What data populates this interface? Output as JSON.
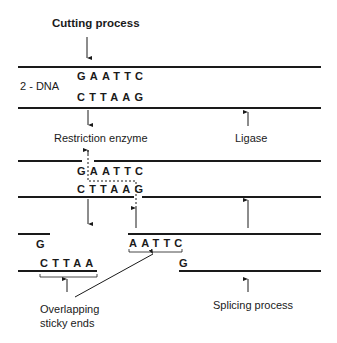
{
  "title": "Cutting process",
  "dna_label": "2 - DNA",
  "stage1": {
    "top_strand": "GAATTC",
    "bottom_strand": "CTTAAG"
  },
  "labels": {
    "restriction_enzyme": "Restriction enzyme",
    "ligase": "Ligase",
    "overlapping_line1": "Overlapping",
    "overlapping_line2": "sticky ends",
    "splicing": "Splicing process"
  },
  "stage2": {
    "top_strand": "GAATTC",
    "bottom_strand": "CTTAAG"
  },
  "stage3": {
    "left_top": "G",
    "left_bottom": "CTTAA",
    "right_top": "AATTC",
    "right_bottom": "G"
  }
}
